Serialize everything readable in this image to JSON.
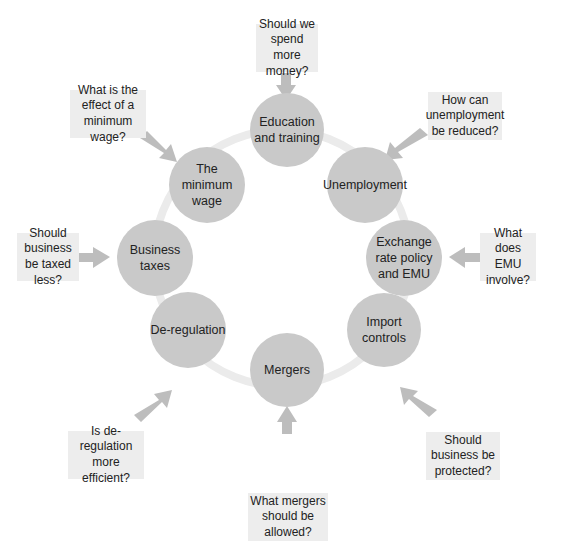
{
  "colors": {
    "node_fill": "#c9c9c9",
    "ring": "#eaeaea",
    "arrow": "#bdbdbd",
    "box_fill": "#ededed"
  },
  "nodes": [
    {
      "label": "Education and training",
      "question": "Should we spend more money?"
    },
    {
      "label": "Unemployment",
      "question": "How can unemployment be reduced?"
    },
    {
      "label": "Exchange rate policy and EMU",
      "question": "What does EMU involve?"
    },
    {
      "label": "Import controls",
      "question": "Should business be protected?"
    },
    {
      "label": "Mergers",
      "question": "What mergers should be allowed?"
    },
    {
      "label": "De-regulation",
      "question": "Is de-regulation more efficient?"
    },
    {
      "label": "Business taxes",
      "question": "Should business be taxed less?"
    },
    {
      "label": "The minimum wage",
      "question": "What is the effect of a minimum wage?"
    }
  ]
}
